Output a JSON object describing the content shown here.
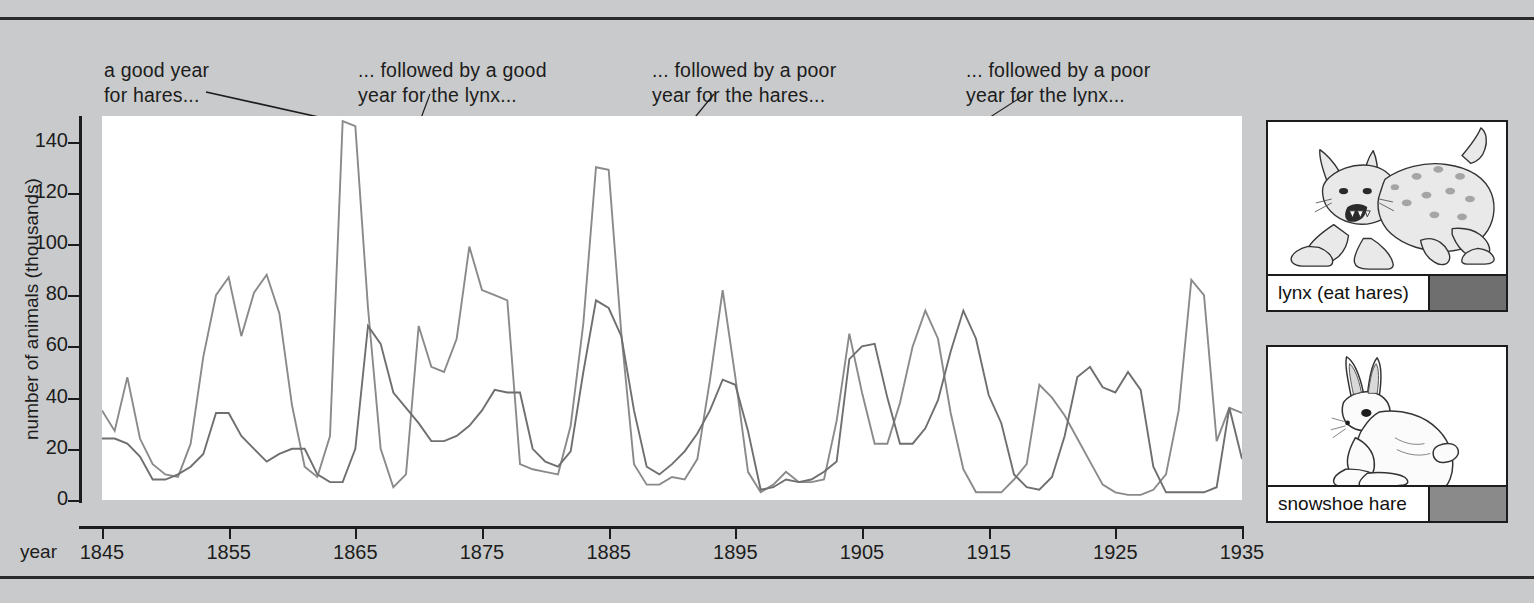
{
  "figure": {
    "background_color": "#c9cacb",
    "plot_background": "#ffffff",
    "axis_color": "#1c1c1c"
  },
  "axes": {
    "x_axis_name": "year",
    "y_axis_title": "number of animals (thousands)",
    "y_ticks": [
      "0",
      "20",
      "40",
      "60",
      "80",
      "100",
      "120",
      "140"
    ],
    "x_ticks": [
      "1845",
      "1855",
      "1865",
      "1875",
      "1885",
      "1895",
      "1905",
      "1915",
      "1925",
      "1935"
    ]
  },
  "annotations": [
    {
      "id": "good-year-hares",
      "line1": "a good year",
      "line2": "for hares..."
    },
    {
      "id": "good-year-lynx",
      "line1": "... followed by a good",
      "line2": "year for the lynx..."
    },
    {
      "id": "poor-year-hares",
      "line1": "... followed by a poor",
      "line2": "year for the hares..."
    },
    {
      "id": "poor-year-lynx",
      "line1": "... followed by a poor",
      "line2": "year for the lynx..."
    }
  ],
  "legend": [
    {
      "id": "lynx",
      "label": "lynx (eat hares)",
      "swatch_color": "#6f6f6f",
      "art": "lynx-drawing"
    },
    {
      "id": "hare",
      "label": "snowshoe hare",
      "swatch_color": "#8a8a8a",
      "art": "snowshoe-hare-drawing"
    }
  ],
  "chart_data": {
    "type": "line",
    "title": "",
    "xlabel": "year",
    "ylabel": "number of animals (thousands)",
    "xlim": [
      1845,
      1935
    ],
    "ylim": [
      0,
      150
    ],
    "grid": false,
    "legend_position": "right",
    "x": [
      1845,
      1846,
      1847,
      1848,
      1849,
      1850,
      1851,
      1852,
      1853,
      1854,
      1855,
      1856,
      1857,
      1858,
      1859,
      1860,
      1861,
      1862,
      1863,
      1864,
      1865,
      1866,
      1867,
      1868,
      1869,
      1870,
      1871,
      1872,
      1873,
      1874,
      1875,
      1876,
      1877,
      1878,
      1879,
      1880,
      1881,
      1882,
      1883,
      1884,
      1885,
      1886,
      1887,
      1888,
      1889,
      1890,
      1891,
      1892,
      1893,
      1894,
      1895,
      1896,
      1897,
      1898,
      1899,
      1900,
      1901,
      1902,
      1903,
      1904,
      1905,
      1906,
      1907,
      1908,
      1909,
      1910,
      1911,
      1912,
      1913,
      1914,
      1915,
      1916,
      1917,
      1918,
      1919,
      1920,
      1921,
      1922,
      1923,
      1924,
      1925,
      1926,
      1927,
      1928,
      1929,
      1930,
      1931,
      1932,
      1933,
      1934,
      1935
    ],
    "series": [
      {
        "name": "snowshoe hare",
        "color": "#8a8a8a",
        "values": [
          35,
          27,
          48,
          24,
          14,
          10,
          9,
          22,
          56,
          80,
          87,
          64,
          81,
          88,
          73,
          37,
          13,
          9,
          25,
          148,
          146,
          75,
          20,
          5,
          10,
          68,
          52,
          50,
          63,
          99,
          82,
          80,
          78,
          14,
          12,
          11,
          10,
          29,
          69,
          130,
          129,
          65,
          14,
          6,
          6,
          9,
          8,
          16,
          47,
          82,
          48,
          11,
          3,
          6,
          11,
          7,
          7,
          8,
          31,
          65,
          42,
          22,
          22,
          38,
          60,
          74,
          63,
          34,
          12,
          3,
          3,
          3,
          8,
          14,
          45,
          40,
          33,
          24,
          15,
          6,
          3,
          2,
          2,
          4,
          10,
          35,
          86,
          80,
          23,
          36,
          34
        ]
      },
      {
        "name": "lynx",
        "color": "#6f6f6f",
        "values": [
          24,
          24,
          22,
          17,
          8,
          8,
          10,
          13,
          18,
          34,
          34,
          25,
          20,
          15,
          18,
          20,
          20,
          10,
          7,
          7,
          20,
          68,
          61,
          42,
          36,
          30,
          23,
          23,
          25,
          29,
          35,
          43,
          42,
          42,
          20,
          15,
          13,
          19,
          50,
          78,
          75,
          64,
          35,
          13,
          10,
          14,
          19,
          26,
          35,
          47,
          45,
          27,
          4,
          5,
          8,
          7,
          8,
          11,
          15,
          55,
          60,
          61,
          40,
          22,
          22,
          28,
          39,
          58,
          74,
          63,
          41,
          30,
          10,
          5,
          4,
          9,
          25,
          48,
          52,
          44,
          42,
          50,
          43,
          13,
          3,
          3,
          3,
          3,
          5,
          36,
          16
        ]
      }
    ],
    "notes": [
      "a good year for hares...",
      "... followed by a good year for the lynx...",
      "... followed by a poor year for the hares...",
      "... followed by a poor year for the lynx..."
    ]
  }
}
